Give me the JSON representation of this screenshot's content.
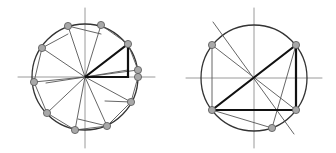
{
  "colors": {
    "background": "#ffffff",
    "axis": "#9a9a9a",
    "circle": "#333333",
    "thin_line": "#555555",
    "thick_line": "#111111",
    "point_fill": "#a8a8a8",
    "point_stroke": "#555555"
  },
  "diagrams": [
    {
      "name": "left-diagram",
      "center": [
        85,
        77
      ],
      "radius": 53,
      "axes": {
        "h": [
          18,
          155
        ],
        "v": [
          8,
          148
        ]
      },
      "points": [
        [
          68,
          26
        ],
        [
          101,
          25
        ],
        [
          128,
          44
        ],
        [
          138,
          70
        ],
        [
          138,
          77
        ],
        [
          131,
          102
        ],
        [
          107,
          126
        ],
        [
          75,
          130
        ],
        [
          47,
          113
        ],
        [
          34,
          82
        ],
        [
          42,
          48
        ]
      ],
      "spokes_to": [
        [
          68,
          26
        ],
        [
          101,
          25
        ],
        [
          128,
          70
        ],
        [
          138,
          70
        ],
        [
          131,
          102
        ],
        [
          107,
          126
        ],
        [
          75,
          130
        ],
        [
          47,
          113
        ],
        [
          34,
          82
        ],
        [
          42,
          48
        ]
      ],
      "chords": [
        [
          [
            68,
            26
          ],
          [
            101,
            34
          ]
        ],
        [
          [
            42,
            48
          ],
          [
            68,
            34
          ]
        ],
        [
          [
            101,
            25
          ],
          [
            128,
            44
          ]
        ],
        [
          [
            42,
            48
          ],
          [
            34,
            82
          ]
        ],
        [
          [
            34,
            82
          ],
          [
            47,
            113
          ]
        ],
        [
          [
            47,
            113
          ],
          [
            75,
            130
          ]
        ],
        [
          [
            75,
            130
          ],
          [
            107,
            126
          ]
        ],
        [
          [
            107,
            126
          ],
          [
            131,
            102
          ]
        ],
        [
          [
            131,
            102
          ],
          [
            138,
            77
          ]
        ],
        [
          [
            128,
            44
          ],
          [
            138,
            70
          ]
        ],
        [
          [
            78,
            119
          ],
          [
            107,
            126
          ]
        ],
        [
          [
            105,
            101
          ],
          [
            131,
            102
          ]
        ],
        [
          [
            46,
            83
          ],
          [
            85,
            77
          ]
        ]
      ],
      "thick_triangle": [
        [
          85,
          77
        ],
        [
          128,
          44
        ],
        [
          128,
          77
        ]
      ]
    },
    {
      "name": "right-diagram",
      "center": [
        254,
        78
      ],
      "radius": 53,
      "axes": {
        "h": [
          186,
          322
        ],
        "v": [
          8,
          148
        ]
      },
      "points": [
        [
          212,
          45
        ],
        [
          296,
          45
        ],
        [
          212,
          110
        ],
        [
          296,
          110
        ],
        [
          272,
          128
        ]
      ],
      "thin_lines": [
        [
          [
            212,
            45
          ],
          [
            212,
            110
          ]
        ],
        [
          [
            212,
            45
          ],
          [
            296,
            110
          ]
        ],
        [
          [
            212,
            110
          ],
          [
            272,
            128
          ]
        ],
        [
          [
            296,
            45
          ],
          [
            272,
            128
          ]
        ],
        [
          [
            213,
            22
          ],
          [
            294,
            134
          ]
        ]
      ],
      "thick_lines": [
        [
          [
            212,
            110
          ],
          [
            296,
            45
          ]
        ],
        [
          [
            296,
            45
          ],
          [
            296,
            110
          ]
        ],
        [
          [
            212,
            110
          ],
          [
            296,
            110
          ]
        ]
      ]
    }
  ]
}
